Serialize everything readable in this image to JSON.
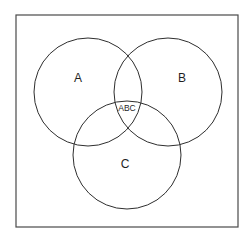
{
  "diagram": {
    "type": "venn",
    "frame": {
      "x": 16,
      "y": 15,
      "width": 222,
      "height": 212
    },
    "colors": {
      "stroke": "#2e2e2e",
      "frame": "#4a4a4a",
      "text": "#1f1f1f",
      "background": "#ffffff"
    },
    "sets": [
      {
        "id": "A",
        "label": "A",
        "cx": 88,
        "cy": 92,
        "r": 54,
        "label_x": 78,
        "label_y": 82
      },
      {
        "id": "B",
        "label": "B",
        "cx": 168,
        "cy": 92,
        "r": 54,
        "label_x": 182,
        "label_y": 82
      },
      {
        "id": "C",
        "label": "C",
        "cx": 127,
        "cy": 155,
        "r": 54,
        "label_x": 125,
        "label_y": 168
      }
    ],
    "intersections": [
      {
        "id": "ABC",
        "label": "ABC",
        "x": 127,
        "y": 111
      }
    ]
  }
}
